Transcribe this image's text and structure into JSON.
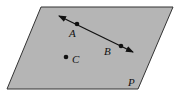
{
  "diagram": {
    "type": "geometry-plane-points",
    "colors": {
      "background": "#ffffff",
      "plane_fill": "#b5b5b5",
      "plane_stroke": "#333333",
      "line_stroke": "#111111",
      "point_fill": "#111111"
    },
    "plane": {
      "label": "P",
      "corners": [
        [
          41,
          7
        ],
        [
          173,
          7
        ],
        [
          138,
          89
        ],
        [
          7,
          89
        ]
      ],
      "label_pos": [
        128,
        86
      ]
    },
    "line": {
      "from": [
        59,
        16
      ],
      "to": [
        133,
        52
      ],
      "arrows": "both",
      "through": [
        "A",
        "B"
      ]
    },
    "points": [
      {
        "name": "A",
        "label": "A",
        "x": 77,
        "y": 24,
        "label_x": 69,
        "label_y": 37
      },
      {
        "name": "B",
        "label": "B",
        "x": 121,
        "y": 46,
        "label_x": 104,
        "label_y": 55
      },
      {
        "name": "C",
        "label": "C",
        "x": 66,
        "y": 57,
        "label_x": 72,
        "label_y": 63
      }
    ]
  }
}
